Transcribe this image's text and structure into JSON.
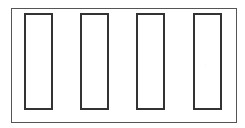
{
  "diagram": {
    "frame": {
      "border_color": "#555555"
    },
    "rectangles": [
      {
        "id": 1,
        "left": 24
      },
      {
        "id": 2,
        "left": 80
      },
      {
        "id": 3,
        "left": 136
      },
      {
        "id": 4,
        "left": 193
      }
    ],
    "stroke_color": "#333333",
    "faint_mark": "·"
  }
}
